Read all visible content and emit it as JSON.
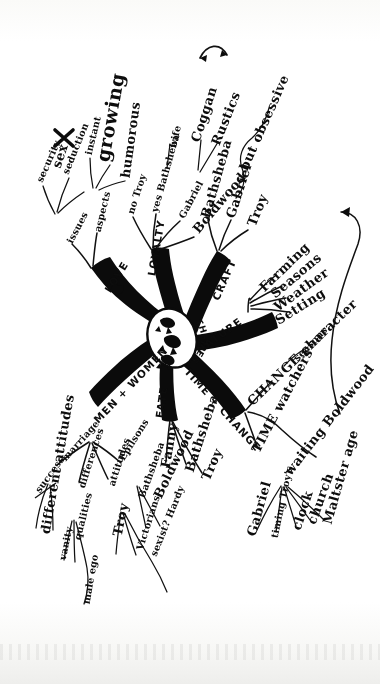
{
  "document": {
    "kind": "hand-drawn-mind-map",
    "title": "Themes",
    "ink_color": "#0b0b0b",
    "paper_color": "#ffffff"
  },
  "center": {
    "label": "THEMES",
    "shape": "ink-blot-oval"
  },
  "branches": [
    {
      "id": "love",
      "label": "LOVE",
      "note": "O drawn as a heart",
      "children": [
        {
          "label": "issues",
          "children": [
            {
              "label": "security"
            },
            {
              "label": "seduction"
            },
            {
              "label": "sex",
              "mark": "X"
            }
          ]
        },
        {
          "label": "aspects",
          "children": [
            {
              "label": "instant"
            },
            {
              "label": "growing"
            },
            {
              "label": "humorous"
            }
          ]
        }
      ]
    },
    {
      "id": "loyalty",
      "label": "LOYALTY",
      "children": [
        {
          "label": "no Troy"
        },
        {
          "label": "yes Bathsheba",
          "children": [
            {
              "label": "wife"
            }
          ]
        },
        {
          "label": "Gabriel",
          "children": [
            {
              "label": "Coggan"
            },
            {
              "label": "Rustics"
            }
          ],
          "link": "double-arrow"
        },
        {
          "label": "Boldwood",
          "children": [
            {
              "label": "but obsessive"
            }
          ]
        }
      ]
    },
    {
      "id": "craft",
      "label": "CRAFT",
      "children": [
        {
          "label": "Bathsheba"
        },
        {
          "label": "Gabriel"
        },
        {
          "label": "Troy"
        }
      ]
    },
    {
      "id": "nature",
      "label": "NATURE",
      "children": [
        {
          "label": "Farming"
        },
        {
          "label": "Seasons"
        },
        {
          "label": "Weather"
        },
        {
          "label": "Setting"
        }
      ]
    },
    {
      "id": "time-change",
      "label": "TIME + CHANGE",
      "children": [
        {
          "label": "CHANGE character",
          "children": [
            {
              "label": "seasons"
            }
          ]
        },
        {
          "label": "TIME watchers",
          "children": [
            {
              "label": "Gabriel"
            },
            {
              "label": "timing Troy's"
            },
            {
              "label": "clock"
            },
            {
              "label": "church"
            },
            {
              "label": "Maltster age"
            }
          ]
        },
        {
          "label": "waiting Boldwood"
        }
      ]
    },
    {
      "id": "fate",
      "label": "FATE",
      "children": [
        {
          "label": "Fanny"
        },
        {
          "label": "Bathsheba"
        },
        {
          "label": "Troy"
        }
      ]
    },
    {
      "id": "men-women",
      "label": "MEN + WOMEN",
      "children": [
        {
          "label": "marriage",
          "children": [
            {
              "label": "success",
              "mark": "strikethrough"
            },
            {
              "label": "different attitudes"
            }
          ]
        },
        {
          "label": "differences",
          "children": [
            {
              "label": "qualities"
            },
            {
              "label": "vanity"
            },
            {
              "label": "male ego"
            }
          ]
        },
        {
          "label": "attitudes",
          "children": [
            {
              "label": "Troy"
            },
            {
              "label": "Victorians"
            },
            {
              "label": "sexist? Hardy"
            }
          ]
        },
        {
          "label": "Epilsons",
          "children": [
            {
              "label": "Bathsheba"
            },
            {
              "label": "Boldwood"
            }
          ]
        }
      ]
    }
  ],
  "annotations": [
    {
      "name": "coggan-rustics-double-arrow",
      "glyph": "double-headed-arrow"
    },
    {
      "name": "nature-pointer-arrow",
      "glyph": "arrow-head"
    },
    {
      "name": "sex-cross-out",
      "glyph": "X"
    },
    {
      "name": "success-strikethrough",
      "glyph": "strike"
    }
  ]
}
